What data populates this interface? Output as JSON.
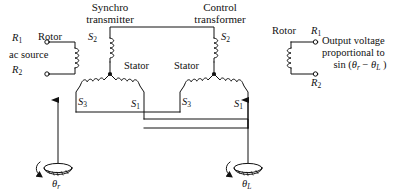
{
  "diagram": {
    "title_transmitter_line1": "Synchro",
    "title_transmitter_line2": "transmitter",
    "title_control_line1": "Control",
    "title_control_line2": "transformer",
    "left": {
      "terminal_top": "R",
      "terminal_top_sub": "1",
      "terminal_bottom": "R",
      "terminal_bottom_sub": "2",
      "rotor_label": "Rotor",
      "source_label": "ac source"
    },
    "right": {
      "rotor_label": "Rotor",
      "terminal_top": "R",
      "terminal_top_sub": "1",
      "terminal_bottom": "R",
      "terminal_bottom_sub": "2",
      "output_line1": "Output voltage",
      "output_line2": "proportional to",
      "output_line3_prefix": "sin (",
      "output_line3_theta1": "θ",
      "output_line3_sub1": "r",
      "output_line3_minus": " − ",
      "output_line3_theta2": "θ",
      "output_line3_sub2": "L",
      "output_line3_suffix": " )"
    },
    "transmitter_stator": {
      "label": "Stator",
      "s2": "S",
      "s2_sub": "2",
      "s3": "S",
      "s3_sub": "3",
      "s1": "S",
      "s1_sub": "1"
    },
    "control_stator": {
      "label": "Stator",
      "s2": "S",
      "s2_sub": "2",
      "s3": "S",
      "s3_sub": "3",
      "s1": "S",
      "s1_sub": "1"
    },
    "shafts": {
      "left_angle": "θ",
      "left_angle_sub": "r",
      "right_angle": "θ",
      "right_angle_sub": "L"
    },
    "colors": {
      "ink": "#111111",
      "background": "#ffffff"
    }
  }
}
